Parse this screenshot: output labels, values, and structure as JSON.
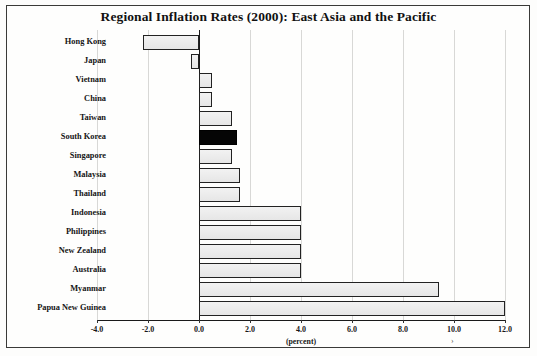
{
  "figure": {
    "title": "Regional Inflation Rates (2000): East Asia and the Pacific",
    "artifact_mark": "›"
  },
  "chart_data": {
    "type": "bar",
    "orientation": "horizontal",
    "title": "Regional Inflation Rates (2000): East Asia and the Pacific",
    "xlabel": "(percent)",
    "ylabel": "",
    "xlim": [
      -4.0,
      12.0
    ],
    "xticks": [
      -4.0,
      -2.0,
      0.0,
      2.0,
      4.0,
      6.0,
      8.0,
      10.0,
      12.0
    ],
    "xtick_labels": [
      "-4.0",
      "-2.0",
      "0.0",
      "2.0",
      "4.0",
      "6.0",
      "8.0",
      "10.0",
      "12.0"
    ],
    "grid": false,
    "legend": null,
    "highlight_category": "South Korea",
    "highlight_color": "#050505",
    "bar_color": "#ececec",
    "bar_edge_color": "#222222",
    "categories": [
      "Hong Kong",
      "Japan",
      "Vietnam",
      "China",
      "Taiwan",
      "South Korea",
      "Singapore",
      "Malaysia",
      "Thailand",
      "Indonesia",
      "Philippines",
      "New Zealand",
      "Australia",
      "Myanmar",
      "Papua New Guinea"
    ],
    "values": [
      -2.2,
      -0.3,
      0.5,
      0.5,
      1.3,
      1.5,
      1.3,
      1.6,
      1.6,
      4.0,
      4.0,
      4.0,
      4.0,
      9.4,
      12.0
    ]
  }
}
